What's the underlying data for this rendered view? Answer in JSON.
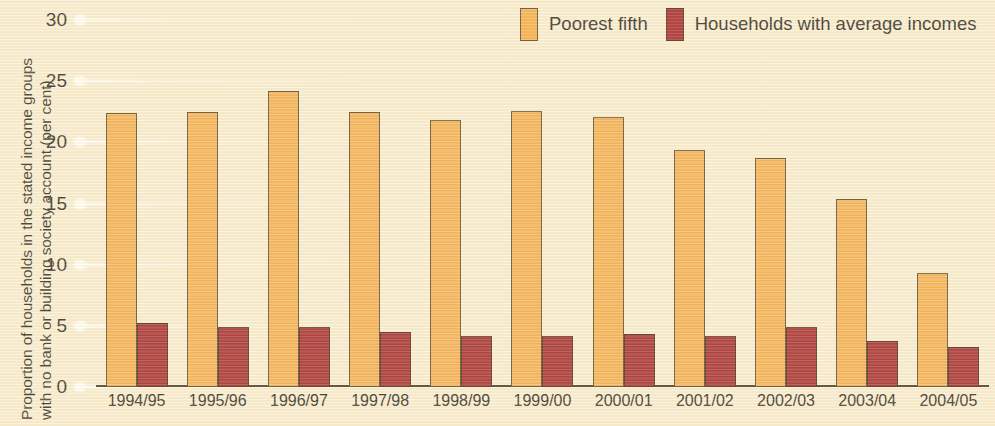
{
  "chart_data": {
    "type": "bar",
    "title": "",
    "subtitle": "",
    "xlabel": "",
    "ylabel": "Proportion of households in the stated income groups with no bank or building society account (per cent)",
    "ylabel_line1": "Proportion of households in the stated income groups",
    "ylabel_line2": "with no bank or building society account (per cent)",
    "ylim": [
      0,
      30
    ],
    "ytick_labels": [
      "0",
      "5",
      "10",
      "15",
      "20",
      "25",
      "30"
    ],
    "ytick_values": [
      0,
      5,
      10,
      15,
      20,
      25,
      30
    ],
    "grid": true,
    "grid_axis": "y",
    "legend_position": "top-right",
    "categories": [
      "1994/95",
      "1995/96",
      "1996/97",
      "1997/98",
      "1998/99",
      "1999/00",
      "2000/01",
      "2001/02",
      "2002/03",
      "2003/04",
      "2004/05"
    ],
    "series": [
      {
        "name": "Poorest fifth",
        "color": "#f4a63d",
        "values": [
          22.4,
          22.5,
          24.2,
          22.5,
          21.8,
          22.6,
          22.1,
          19.4,
          18.7,
          15.4,
          9.3
        ]
      },
      {
        "name": "Households with average incomes",
        "color": "#9d1519",
        "values": [
          5.2,
          4.9,
          4.9,
          4.5,
          4.2,
          4.2,
          4.3,
          4.2,
          4.9,
          3.8,
          3.3
        ]
      }
    ]
  },
  "legend": {
    "items": [
      {
        "label": "Poorest fifth",
        "color": "#f4a63d"
      },
      {
        "label": "Households with average incomes",
        "color": "#9d1519"
      }
    ]
  },
  "colors": {
    "background": "#f8edd0",
    "series_a": "#f4a63d",
    "series_b": "#9d1519",
    "axis": "#3a2c16",
    "text": "#16120e",
    "gridline": "#ffffff"
  }
}
